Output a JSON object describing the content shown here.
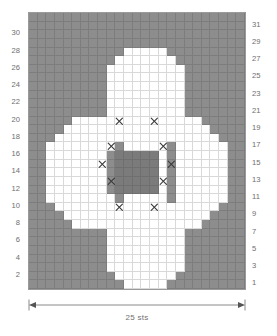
{
  "chart_data": {
    "type": "heatmap",
    "title": "",
    "subtitle": "",
    "xlabel": "25 sts",
    "ylabel": "",
    "grid": true,
    "legend_position": "none",
    "columns": 25,
    "rows": 32,
    "row_numbers_left": [
      30,
      28,
      26,
      24,
      22,
      20,
      18,
      16,
      14,
      12,
      10,
      8,
      6,
      4,
      2
    ],
    "row_numbers_right": [
      31,
      29,
      27,
      25,
      23,
      21,
      19,
      17,
      15,
      13,
      11,
      9,
      7,
      5,
      3,
      1
    ],
    "cell_categories": [
      "background",
      "petal",
      "core"
    ],
    "cell_colors": {
      "background": "#8d8d8d",
      "petal": "#ffffff",
      "core": "#7b7b7b",
      "gridline": "#787878",
      "border": "#9a9a9a",
      "text": "#6e6e6e",
      "symbol": "#3a3a3a"
    },
    "symbols": [
      {
        "name": "cross-stitch",
        "glyph": "X"
      }
    ],
    "rows_top_to_bottom": [
      "0000000000000000000000000",
      "0000000000000000000000000",
      "0000000000000000000000000",
      "0000000000000000000000000",
      "0000000000011111000000000",
      "0000000000111111100000000",
      "0000000001111111110000000",
      "0000000001111111110000000",
      "0000000001111111110000000",
      "0000000001111111110000000",
      "0000000001111111110000000",
      "0000000001111111110000000",
      "0000011111111111111100000",
      "0000111111111111111110000",
      "0001111111111111111111000",
      "0011111111011111011111100",
      "0011111110222221011111100",
      "0011111110222221011111100",
      "0011111110222221011111100",
      "0011111110222221011111100",
      "0011111110222221011111100",
      "0011111111011111011111100",
      "0001111111111111111111000",
      "0000111111111111111110000",
      "0000011111111111111100000",
      "0000000001111111110000000",
      "0000000001111111110000000",
      "0000000001111111110000000",
      "0000000001111111110000000",
      "0000000001111111110000000",
      "0000000000111111100000000",
      "0000000000011111000000000"
    ],
    "symbol_cells": [
      {
        "col": 10,
        "row": 12,
        "symbol": "X"
      },
      {
        "col": 14,
        "row": 12,
        "symbol": "X"
      },
      {
        "col": 9,
        "row": 15,
        "symbol": "X"
      },
      {
        "col": 15,
        "row": 15,
        "symbol": "X"
      },
      {
        "col": 8,
        "row": 17,
        "symbol": "X"
      },
      {
        "col": 16,
        "row": 17,
        "symbol": "X"
      },
      {
        "col": 9,
        "row": 19,
        "symbol": "X"
      },
      {
        "col": 15,
        "row": 19,
        "symbol": "X"
      },
      {
        "col": 10,
        "row": 22,
        "symbol": "X"
      },
      {
        "col": 14,
        "row": 22,
        "symbol": "X"
      }
    ]
  },
  "caption": {
    "width_label": "25 sts"
  }
}
